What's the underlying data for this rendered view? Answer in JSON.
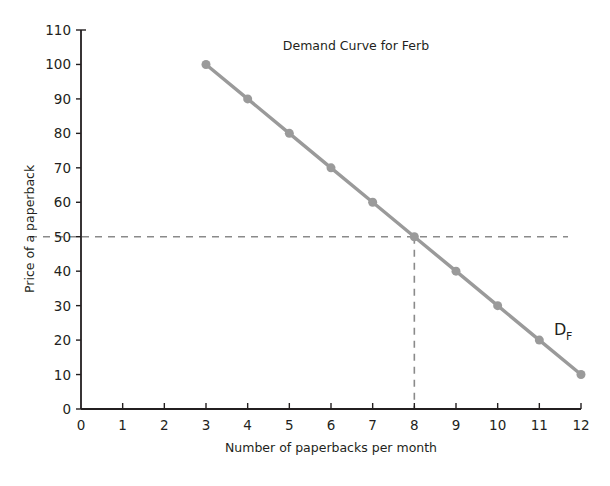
{
  "chart_data": {
    "type": "line",
    "title": "Demand Curve for Ferb",
    "xlabel": "Number of paperbacks per month",
    "ylabel": "Price of a paperback",
    "xlim": [
      0,
      12
    ],
    "ylim": [
      0,
      110
    ],
    "grid": false,
    "legend": "none",
    "x_ticks": [
      "0",
      "1",
      "2",
      "3",
      "4",
      "5",
      "6",
      "7",
      "8",
      "9",
      "10",
      "11",
      "12"
    ],
    "y_ticks": [
      "0",
      "10",
      "20",
      "30",
      "40",
      "50",
      "60",
      "70",
      "80",
      "90",
      "100",
      "110"
    ],
    "series": [
      {
        "name": "D_F",
        "label_main": "D",
        "label_sub": "F",
        "color": "#9a9a9a",
        "x": [
          3,
          4,
          5,
          6,
          7,
          8,
          9,
          10,
          11,
          12
        ],
        "y": [
          100,
          90,
          80,
          70,
          60,
          50,
          40,
          30,
          20,
          10
        ]
      }
    ],
    "annotations": [
      {
        "name": "equilibrium-guide",
        "type": "crosshair",
        "x": 8,
        "y": 50,
        "style": "dashed",
        "color": "#8a8a8a"
      }
    ],
    "marker": {
      "shape": "circle",
      "radius": 4.5,
      "color": "#9a9a9a"
    }
  },
  "axis_colors": {
    "axis_line": "#231f20",
    "curve": "#9a9a9a",
    "guide": "#8a8a8a"
  }
}
